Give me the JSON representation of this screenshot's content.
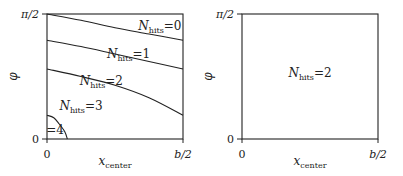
{
  "chart_data": [
    {
      "type": "line",
      "panel": "left",
      "xlabel": "x",
      "xlabel_sub": "center",
      "ylabel": "φ",
      "xlim": [
        0,
        1
      ],
      "ylim": [
        0,
        1
      ],
      "x_ticks": [
        {
          "value": 0,
          "label": "0"
        },
        {
          "value": 1,
          "label": "b/2"
        }
      ],
      "y_ticks": [
        {
          "value": 0,
          "label": "0"
        },
        {
          "value": 1,
          "label": "π/2"
        }
      ],
      "axis_units_note": "x normalized to b/2, y normalized to π/2",
      "boundaries": [
        {
          "name": "boundary-0-1",
          "points": [
            [
              0,
              1.0
            ],
            [
              0.25,
              0.95
            ],
            [
              0.5,
              0.89
            ],
            [
              0.75,
              0.84
            ],
            [
              1.0,
              0.79
            ]
          ]
        },
        {
          "name": "boundary-1-2",
          "points": [
            [
              0,
              0.79
            ],
            [
              0.25,
              0.74
            ],
            [
              0.5,
              0.68
            ],
            [
              0.75,
              0.62
            ],
            [
              1.0,
              0.56
            ]
          ]
        },
        {
          "name": "boundary-2-3",
          "points": [
            [
              0,
              0.56
            ],
            [
              0.25,
              0.5
            ],
            [
              0.5,
              0.43
            ],
            [
              0.75,
              0.33
            ],
            [
              1.0,
              0.19
            ]
          ]
        },
        {
          "name": "boundary-3-4",
          "points": [
            [
              0,
              0.19
            ],
            [
              0.05,
              0.17
            ],
            [
              0.09,
              0.12
            ],
            [
              0.13,
              0.06
            ],
            [
              0.15,
              0.0
            ]
          ]
        }
      ],
      "region_labels": [
        {
          "text": "N",
          "sub": "hits",
          "value": "=0",
          "x": 0.83,
          "y": 0.87
        },
        {
          "text": "N",
          "sub": "hits",
          "value": "=1",
          "x": 0.6,
          "y": 0.65
        },
        {
          "text": "N",
          "sub": "hits",
          "value": "=2",
          "x": 0.4,
          "y": 0.43
        },
        {
          "text": "N",
          "sub": "hits",
          "value": "=3",
          "x": 0.25,
          "y": 0.23
        },
        {
          "text": "",
          "sub": "",
          "value": "=4",
          "x": 0.06,
          "y": 0.04
        }
      ]
    },
    {
      "type": "line",
      "panel": "right",
      "xlabel": "x",
      "xlabel_sub": "center",
      "ylabel": "φ",
      "xlim": [
        0,
        1
      ],
      "ylim": [
        0,
        1
      ],
      "x_ticks": [
        {
          "value": 0,
          "label": "0"
        },
        {
          "value": 1,
          "label": "b/2"
        }
      ],
      "y_ticks": [
        {
          "value": 0,
          "label": "0"
        },
        {
          "value": 1,
          "label": "π/2"
        }
      ],
      "boundaries": [],
      "region_labels": [
        {
          "text": "N",
          "sub": "hits",
          "value": "=2",
          "x": 0.5,
          "y": 0.5
        }
      ]
    }
  ]
}
